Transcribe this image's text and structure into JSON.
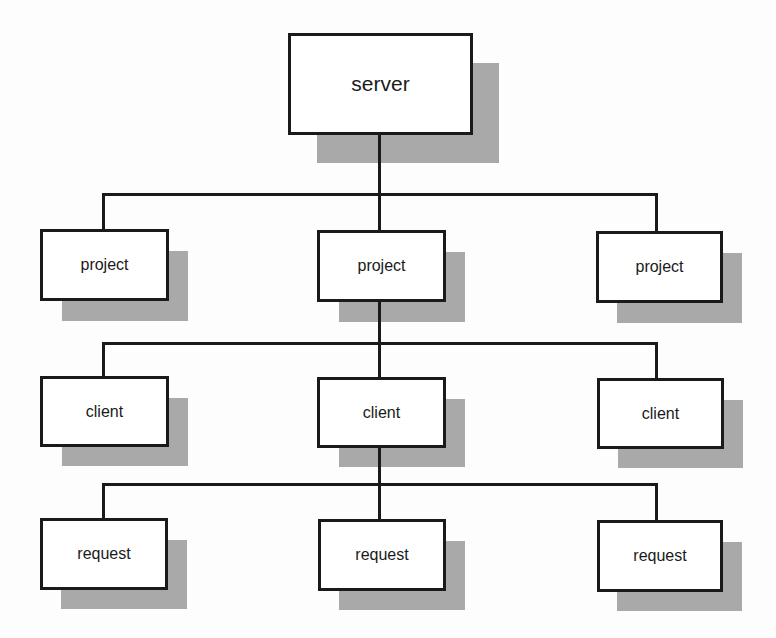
{
  "diagram": {
    "type": "hierarchy-tree",
    "colors": {
      "line": "#1a1a1a",
      "box_fill": "#ffffff",
      "shadow": "#a9a9a9",
      "background": "#fdfdfd"
    },
    "root": {
      "label": "server"
    },
    "level1": [
      {
        "label": "project"
      },
      {
        "label": "project"
      },
      {
        "label": "project"
      }
    ],
    "level2": [
      {
        "label": "client"
      },
      {
        "label": "client"
      },
      {
        "label": "client"
      }
    ],
    "level3": [
      {
        "label": "request"
      },
      {
        "label": "request"
      },
      {
        "label": "request"
      }
    ],
    "edges": [
      [
        "server",
        "project[0]"
      ],
      [
        "server",
        "project[1]"
      ],
      [
        "server",
        "project[2]"
      ],
      [
        "project[1]",
        "client[0]"
      ],
      [
        "project[1]",
        "client[1]"
      ],
      [
        "project[1]",
        "client[2]"
      ],
      [
        "client[1]",
        "request[0]"
      ],
      [
        "client[1]",
        "request[1]"
      ],
      [
        "client[1]",
        "request[2]"
      ]
    ]
  }
}
